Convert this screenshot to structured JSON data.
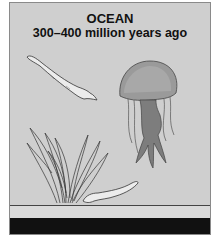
{
  "scene": {
    "title": "OCEAN",
    "subtitle": "300–400 million years ago"
  },
  "organisms": [
    {
      "name": "eel-like fish (upper left)"
    },
    {
      "name": "jellyfish"
    },
    {
      "name": "seaweed"
    },
    {
      "name": "eel-like fish (lower)"
    }
  ],
  "colors": {
    "water": "#cfcfcf",
    "floor": "#dadada",
    "bedrock": "#111111",
    "jellyfish_bell": "#9a9a9a",
    "jellyfish_body": "#7d7d7d"
  }
}
